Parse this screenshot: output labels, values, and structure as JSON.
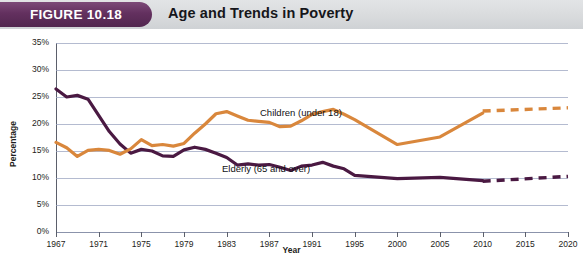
{
  "header": {
    "figure_badge": "FIGURE 10.18",
    "title": "Age and Trends in Poverty"
  },
  "axes": {
    "ylabel": "Percentage",
    "xlabel": "Year",
    "yticks": [
      "35%",
      "30%",
      "25%",
      "20%",
      "15%",
      "10%",
      "5%",
      "0%"
    ],
    "xticks": [
      "1967",
      "1971",
      "1975",
      "1979",
      "1983",
      "1987",
      "1991",
      "1995",
      "2000",
      "2005",
      "2010",
      "2015",
      "2020"
    ]
  },
  "labels": {
    "children": "Children (under 18)",
    "elderly": "Elderly (65 and over)"
  },
  "colors": {
    "children": "#D9873C",
    "elderly": "#4A1942",
    "badge": "#63305F",
    "header_bar": "#D9DBDD",
    "grid": "#9BA4C0"
  },
  "chart_data": {
    "type": "line",
    "title": "Age and Trends in Poverty",
    "xlabel": "Year",
    "ylabel": "Percentage",
    "ylim": [
      0,
      35
    ],
    "xlim": [
      1967,
      2020
    ],
    "grid": true,
    "legend": "inline-labels",
    "x": [
      1967,
      1968,
      1969,
      1970,
      1971,
      1972,
      1973,
      1974,
      1975,
      1976,
      1977,
      1978,
      1979,
      1980,
      1981,
      1982,
      1983,
      1984,
      1985,
      1986,
      1987,
      1988,
      1989,
      1990,
      1991,
      1992,
      1993,
      1994,
      1995,
      2000,
      2005,
      2010
    ],
    "series": [
      {
        "name": "Children (under 18)",
        "color": "#D9873C",
        "style": "solid",
        "values": [
          16.6,
          15.6,
          14.0,
          15.1,
          15.3,
          15.1,
          14.4,
          15.4,
          17.1,
          16.0,
          16.2,
          15.9,
          16.4,
          18.3,
          20.0,
          21.9,
          22.3,
          21.5,
          20.7,
          20.5,
          20.3,
          19.5,
          19.6,
          20.6,
          21.8,
          22.3,
          22.7,
          21.8,
          20.8,
          16.2,
          17.6,
          22.0
        ]
      },
      {
        "name": "Elderly (65 and over)",
        "color": "#4A1942",
        "style": "solid",
        "values": [
          26.5,
          25.0,
          25.3,
          24.6,
          21.6,
          18.6,
          16.3,
          14.6,
          15.3,
          15.0,
          14.1,
          14.0,
          15.2,
          15.7,
          15.3,
          14.6,
          13.8,
          12.4,
          12.6,
          12.4,
          12.5,
          12.0,
          11.4,
          12.2,
          12.4,
          12.9,
          12.2,
          11.7,
          10.5,
          9.9,
          10.1,
          9.5
        ]
      }
    ],
    "projections": [
      {
        "name": "Children (under 18) projected",
        "color": "#D9873C",
        "style": "dashed",
        "x": [
          2010,
          2020
        ],
        "values": [
          22.4,
          23.0
        ]
      },
      {
        "name": "Elderly (65 and over) projected",
        "color": "#4A1942",
        "style": "dashed",
        "x": [
          2010,
          2020
        ],
        "values": [
          9.4,
          10.3
        ]
      }
    ]
  }
}
